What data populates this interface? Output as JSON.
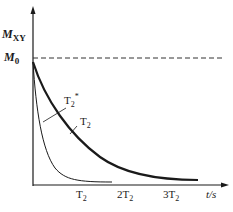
{
  "diagram": {
    "y_axis": {
      "label_main": "M",
      "label_sub": "XY"
    },
    "reference_line": {
      "label_main": "M",
      "label_sub": "0",
      "style": "dashed"
    },
    "x_axis": {
      "label": "t/s",
      "ticks": [
        {
          "coef": "",
          "main": "T",
          "sub": "2"
        },
        {
          "coef": "2",
          "main": "T",
          "sub": "2"
        },
        {
          "coef": "3",
          "main": "T",
          "sub": "2"
        }
      ]
    },
    "curves": [
      {
        "name": "T2*",
        "label_main": "T",
        "label_sub": "2",
        "label_sup": "*",
        "description": "fast decay"
      },
      {
        "name": "T2",
        "label_main": "T",
        "label_sub": "2",
        "label_sup": "",
        "description": "slow decay (thick)"
      }
    ],
    "colors": {
      "axis": "#1a1a1a",
      "curve": "#1a1a1a",
      "dash": "#333333"
    }
  }
}
